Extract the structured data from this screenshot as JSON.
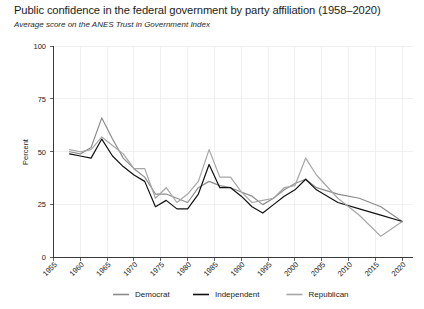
{
  "chart_data": {
    "type": "line",
    "title": "Public confidence in the federal government by party affiliation (1958–2020)",
    "subtitle": "Average score on the ANES Trust in Government Index",
    "xlabel": "",
    "ylabel": "Percent",
    "xlim": [
      1955,
      2022
    ],
    "ylim": [
      0,
      100
    ],
    "grid": true,
    "legend_position": "bottom",
    "yticks": [
      "0",
      "25",
      "50",
      "75",
      "100"
    ],
    "ytick_values": [
      0,
      25,
      50,
      75,
      100
    ],
    "xticks": [
      "1955",
      "1960",
      "1965",
      "1970",
      "1975",
      "1980",
      "1985",
      "1990",
      "1995",
      "2000",
      "2005",
      "2010",
      "2015",
      "2020"
    ],
    "xtick_values": [
      1955,
      1960,
      1965,
      1970,
      1975,
      1980,
      1985,
      1990,
      1995,
      2000,
      2005,
      2010,
      2015,
      2020
    ],
    "x": [
      1958,
      1960,
      1962,
      1964,
      1966,
      1968,
      1970,
      1972,
      1974,
      1976,
      1978,
      1980,
      1982,
      1984,
      1986,
      1988,
      1990,
      1992,
      1994,
      1996,
      1998,
      2000,
      2002,
      2004,
      2008,
      2012,
      2016,
      2020
    ],
    "series": [
      {
        "name": "Democrat",
        "color": "#8c8c8c",
        "values": [
          50,
          49,
          52,
          66,
          56,
          47,
          42,
          38,
          30,
          30,
          28,
          26,
          33,
          36,
          34,
          33,
          31,
          29,
          25,
          28,
          32,
          35,
          37,
          33,
          30,
          28,
          24,
          17
        ]
      },
      {
        "name": "Independent",
        "color": "#111111",
        "values": [
          49,
          48,
          47,
          56,
          48,
          43,
          39,
          36,
          24,
          27,
          23,
          23,
          30,
          44,
          33,
          33,
          29,
          24,
          21,
          25,
          29,
          32,
          37,
          32,
          26,
          23,
          20,
          17
        ]
      },
      {
        "name": "Republican",
        "color": "#a6a6a6",
        "values": [
          51,
          50,
          51,
          57,
          53,
          49,
          42,
          42,
          28,
          33,
          26,
          30,
          36,
          51,
          38,
          38,
          31,
          26,
          27,
          28,
          33,
          34,
          47,
          39,
          28,
          20,
          10,
          17
        ]
      }
    ]
  },
  "legend": {
    "items": [
      {
        "label": "Democrat"
      },
      {
        "label": "Independent"
      },
      {
        "label": "Republican"
      }
    ]
  }
}
